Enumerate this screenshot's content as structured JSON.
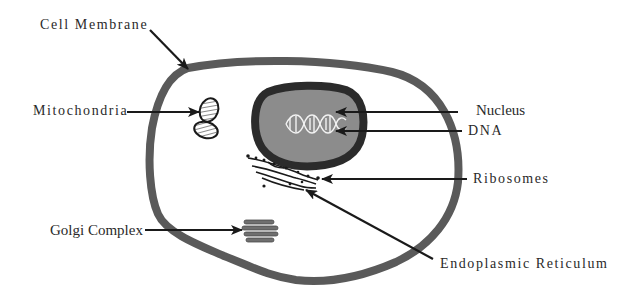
{
  "diagram": {
    "colors": {
      "membrane": "#5a5a5a",
      "nucleus_envelope": "#2b2b2b",
      "nucleoplasm": "#8c8c8c",
      "dna": "#f2f2f2",
      "arrow": "#1a1a1a",
      "text": "#2a2a2a",
      "background": "#ffffff"
    },
    "labels": {
      "cell_membrane": "Cell Membrane",
      "mitochondria": "Mitochondria",
      "nucleus": "Nucleus",
      "dna": "DNA",
      "ribosomes": "Ribosomes",
      "golgi_complex": "Golgi Complex",
      "endoplasmic_reticulum": "Endoplasmic Reticulum"
    }
  }
}
